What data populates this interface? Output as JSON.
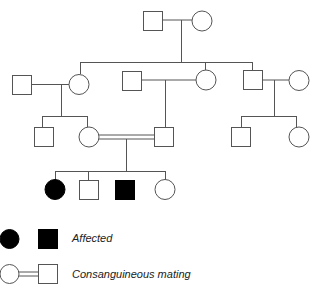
{
  "diagram": {
    "type": "pedigree",
    "colors": {
      "line": "#555555",
      "affected_fill": "#000000",
      "unaffected_fill": "#ffffff"
    },
    "generations": [
      {
        "id": "I",
        "members": [
          {
            "id": "I-1",
            "sex": "male",
            "affected": false
          },
          {
            "id": "I-2",
            "sex": "female",
            "affected": false
          }
        ]
      },
      {
        "id": "II",
        "members": [
          {
            "id": "II-1",
            "sex": "male",
            "affected": false,
            "note": "spouse"
          },
          {
            "id": "II-2",
            "sex": "female",
            "affected": false
          },
          {
            "id": "II-3",
            "sex": "male",
            "affected": false,
            "note": "spouse"
          },
          {
            "id": "II-4",
            "sex": "female",
            "affected": false
          },
          {
            "id": "II-5",
            "sex": "male",
            "affected": false
          },
          {
            "id": "II-6",
            "sex": "female",
            "affected": false,
            "note": "spouse"
          }
        ]
      },
      {
        "id": "III",
        "members": [
          {
            "id": "III-1",
            "sex": "male",
            "affected": false
          },
          {
            "id": "III-2",
            "sex": "female",
            "affected": false
          },
          {
            "id": "III-3",
            "sex": "male",
            "affected": false
          },
          {
            "id": "III-4",
            "sex": "male",
            "affected": false
          },
          {
            "id": "III-5",
            "sex": "female",
            "affected": false
          }
        ]
      },
      {
        "id": "IV",
        "members": [
          {
            "id": "IV-1",
            "sex": "female",
            "affected": true
          },
          {
            "id": "IV-2",
            "sex": "male",
            "affected": false
          },
          {
            "id": "IV-3",
            "sex": "male",
            "affected": true
          },
          {
            "id": "IV-4",
            "sex": "female",
            "affected": false
          }
        ]
      }
    ],
    "consanguineous_union": [
      "III-2",
      "III-3"
    ]
  },
  "legend": {
    "affected_label": "Affected",
    "consanguineous_label": "Consanguineous mating"
  }
}
